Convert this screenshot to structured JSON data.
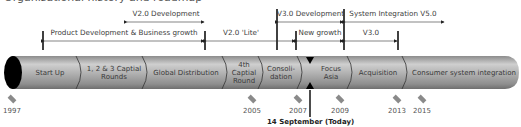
{
  "header": {
    "title": "Organisational history and roadmap"
  },
  "ranges": {
    "product_dev": "Product Development & Business growth",
    "v2_dev": "V2.0 Development",
    "v2_lite": "V2.0 'Lite'",
    "v3_dev": "V3.0 Development",
    "sys_int": "System Integration V5.0",
    "new_growth": "New growth",
    "v3": "V3.0"
  },
  "segments": [
    {
      "label": "Start Up"
    },
    {
      "label": "1, 2 & 3 Captial Rounds"
    },
    {
      "label": "Global Distribution"
    },
    {
      "label": "4th Captial Round"
    },
    {
      "label": "Consoli-dation"
    },
    {
      "label": "Focus Asia"
    },
    {
      "label": "Acquisition"
    },
    {
      "label": "Consumer system integration"
    }
  ],
  "milestones": [
    {
      "year": "1997"
    },
    {
      "year": "2005"
    },
    {
      "year": "2007"
    },
    {
      "year": "2009"
    },
    {
      "year": "2013"
    },
    {
      "year": "2015"
    }
  ],
  "today": {
    "label": "14 September (Today)"
  },
  "colors": {
    "tube": "#9a9a9a",
    "tube_highlight": "#d8d8d8",
    "marker": "#111111",
    "diamond": "#8a8a8a"
  }
}
